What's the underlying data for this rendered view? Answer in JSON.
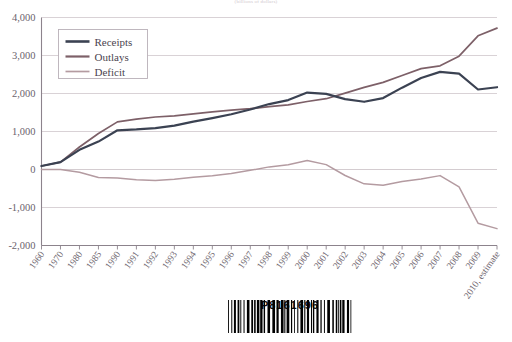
{
  "chart_data": {
    "type": "line",
    "title": "",
    "subtitle": "(billions of dollars)",
    "xlabel": "",
    "ylabel": "",
    "ylim": [
      -2000,
      4000
    ],
    "yticks": [
      "4,000",
      "3,000",
      "2,000",
      "1,000",
      "0",
      "-1,000",
      "-2,000"
    ],
    "ytick_values": [
      4000,
      3000,
      2000,
      1000,
      0,
      -1000,
      -2000
    ],
    "grid": true,
    "legend_position": "top-left",
    "categories": [
      "1960",
      "1970",
      "1980",
      "1985",
      "1990",
      "1991",
      "1992",
      "1993",
      "1994",
      "1995",
      "1996",
      "1997",
      "1998",
      "1999",
      "2000",
      "2001",
      "2002",
      "2003",
      "2004",
      "2005",
      "2006",
      "2007",
      "2008",
      "2009",
      "2010, estimate"
    ],
    "series": [
      {
        "name": "Receipts",
        "color": "#3b4252",
        "values": [
          93,
          193,
          517,
          734,
          1032,
          1055,
          1091,
          1154,
          1259,
          1352,
          1453,
          1579,
          1722,
          1827,
          2025,
          1991,
          1853,
          1782,
          1880,
          2154,
          2407,
          2568,
          2524,
          2105,
          2165
        ]
      },
      {
        "name": "Outlays",
        "color": "#7d6068",
        "values": [
          92,
          196,
          591,
          946,
          1253,
          1324,
          1382,
          1409,
          1462,
          1516,
          1561,
          1601,
          1653,
          1702,
          1789,
          1863,
          2011,
          2160,
          2293,
          2472,
          2655,
          2729,
          2983,
          3518,
          3721
        ]
      },
      {
        "name": "Deficit",
        "color": "#b49ba1",
        "values": [
          0,
          -3,
          -74,
          -212,
          -221,
          -269,
          -291,
          -255,
          -203,
          -164,
          -108,
          -22,
          69,
          126,
          236,
          128,
          -158,
          -378,
          -413,
          -318,
          -248,
          -161,
          -459,
          -1413,
          -1556
        ]
      }
    ]
  },
  "legend": {
    "items": [
      {
        "label": "Receipts",
        "color": "#3b4252"
      },
      {
        "label": "Outlays",
        "color": "#7d6068"
      },
      {
        "label": "Deficit",
        "color": "#b49ba1"
      }
    ]
  },
  "barcode": {
    "number": "P8161696",
    "alt": "barcode"
  }
}
